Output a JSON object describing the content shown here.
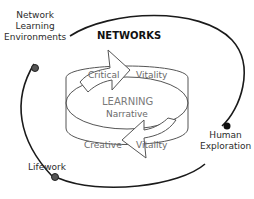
{
  "diagram": {
    "title": "NETWORKS",
    "center": {
      "title": "LEARNING",
      "subtitle": "Narrative"
    },
    "top_arrow": {
      "left": "Critical",
      "right": "Vitality"
    },
    "bottom_arrow": {
      "left": "Creative",
      "right": "Vitality"
    },
    "nodes": [
      {
        "label_lines": [
          "Network",
          "Learning",
          "Environments"
        ]
      },
      {
        "label_lines": [
          "Human",
          "Exploration"
        ]
      },
      {
        "label_lines": [
          "Lifework"
        ]
      }
    ]
  }
}
